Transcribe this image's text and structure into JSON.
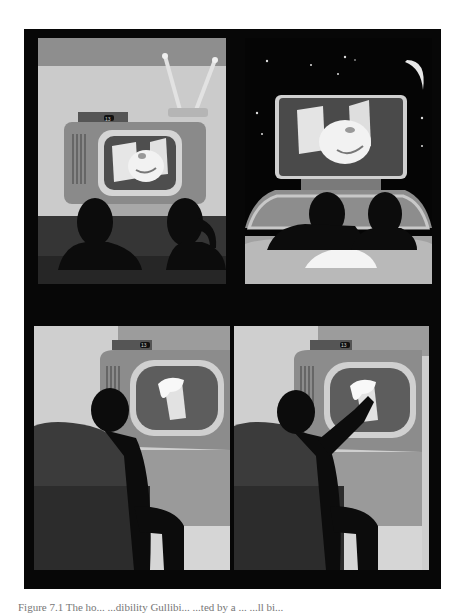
{
  "figure": {
    "panels": [
      {
        "id": "top-left",
        "scene": "couple-watching-tv-at-home",
        "tv_display": "13",
        "screen_content": "monster-with-buildings"
      },
      {
        "id": "top-right",
        "scene": "couple-at-drive-in-movie-night",
        "screen_content": "monster-with-buildings"
      },
      {
        "id": "bottom-left",
        "scene": "man-in-armchair-watching-beer-ad",
        "tv_display": "13",
        "screen_content": "foaming-beer-mug"
      },
      {
        "id": "bottom-right",
        "scene": "man-reaching-for-beer-on-tv",
        "tv_display": "13",
        "screen_content": "foaming-beer-mug"
      }
    ],
    "colors": {
      "frame": "#070707",
      "wall_light": "#c9c9c9",
      "wall_mid": "#9a9a9a",
      "tv_body": "#8c8c8c",
      "screen": "#5a5a5a",
      "silhouette": "#0d0d0d",
      "sofa": "#3a3a3a",
      "night_sky": "#050505"
    }
  },
  "caption": {
    "text": "Figure 7.1 The ho...     ...dibility      Gullibi... ...ted by a ...  ...ll bi..."
  }
}
